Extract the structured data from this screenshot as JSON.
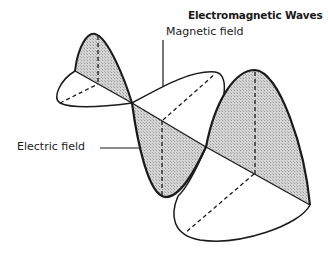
{
  "title": "Electromagnetic Waves",
  "labels": {
    "magnetic": "Magnetic field",
    "electric": "Electric field"
  },
  "colors": {
    "stroke": "#1a1a1a",
    "shade": "#c8c8c8",
    "background": "#ffffff"
  }
}
